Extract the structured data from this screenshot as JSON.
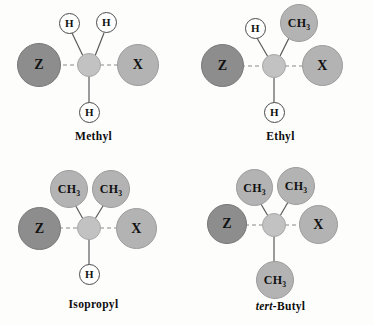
{
  "figure": {
    "background_color": "#fdfdfc"
  },
  "colors": {
    "leaving_group_z": "#8d8d8d",
    "nucleophile_x": "#b3b3b3",
    "methyl_group": "#b3b3b3",
    "central_carbon": "#c2c2c2",
    "hydrogen": "#ffffff",
    "bond_solid": "#5a5a5a",
    "bond_dashed": "#8a8a8a",
    "text": "#0d0d0d"
  },
  "panels": [
    {
      "id": "methyl",
      "caption": "Methyl",
      "caption_italic_prefix": "",
      "caption_rest": "Methyl",
      "atoms": {
        "z": "Z",
        "x": "X",
        "center": "",
        "upper_left": "H",
        "upper_right": "H",
        "bottom": "H"
      },
      "upper_left_type": "hydrogen",
      "upper_right_type": "hydrogen",
      "bottom_type": "hydrogen"
    },
    {
      "id": "ethyl",
      "caption": "Ethyl",
      "caption_italic_prefix": "",
      "caption_rest": "Ethyl",
      "atoms": {
        "z": "Z",
        "x": "X",
        "center": "",
        "upper_left": "H",
        "upper_right": "CH3",
        "bottom": "H"
      },
      "upper_left_type": "hydrogen",
      "upper_right_type": "methyl",
      "bottom_type": "hydrogen"
    },
    {
      "id": "isopropyl",
      "caption": "Isopropyl",
      "caption_italic_prefix": "",
      "caption_rest": "Isopropyl",
      "atoms": {
        "z": "Z",
        "x": "X",
        "center": "",
        "upper_left": "CH3",
        "upper_right": "CH3",
        "bottom": "H"
      },
      "upper_left_type": "methyl",
      "upper_right_type": "methyl",
      "bottom_type": "hydrogen"
    },
    {
      "id": "tert-butyl",
      "caption": "tert-Butyl",
      "caption_italic_prefix": "tert-",
      "caption_rest": "Butyl",
      "atoms": {
        "z": "Z",
        "x": "X",
        "center": "",
        "upper_left": "CH3",
        "upper_right": "CH3",
        "bottom": "CH3"
      },
      "upper_left_type": "methyl",
      "upper_right_type": "methyl",
      "bottom_type": "methyl"
    }
  ],
  "labels": {
    "ch3_base": "CH",
    "ch3_sub": "3",
    "h": "H",
    "z": "Z",
    "x": "X"
  }
}
